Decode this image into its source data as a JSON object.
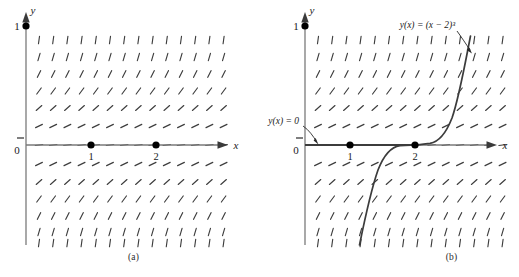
{
  "figure": {
    "panels": [
      {
        "id": "a",
        "caption": "(a)",
        "axes": {
          "x_label": "x",
          "y_label": "y",
          "y_tick_label": "1",
          "origin_label": "0"
        },
        "marked_points": [
          {
            "label": "1",
            "x": 1,
            "y": 0
          },
          {
            "label": "2",
            "x": 2,
            "y": 0
          }
        ],
        "annotations": [],
        "curves": []
      },
      {
        "id": "b",
        "caption": "(b)",
        "axes": {
          "x_label": "x",
          "y_label": "y",
          "y_tick_label": "1",
          "origin_label": "0"
        },
        "marked_points": [
          {
            "label": "1",
            "x": 1,
            "y": 0
          },
          {
            "label": "2",
            "x": 2,
            "y": 0
          }
        ],
        "annotations": [
          {
            "name": "zero-solution-label",
            "text": "y(x) = 0"
          },
          {
            "name": "cubic-solution-label",
            "text": "y(x) = (x − 2)³"
          }
        ],
        "curves": [
          {
            "name": "zero-solution",
            "equation": "y = 0"
          },
          {
            "name": "cubic-solution",
            "equation": "y = (x - 2)^3"
          }
        ]
      }
    ]
  },
  "chart_data": {
    "type": "line",
    "xlabel": "x",
    "ylabel": "y",
    "xlim": [
      -0.35,
      3.6
    ],
    "ylim": [
      -1.05,
      1.15
    ],
    "grid": false,
    "legend": "none",
    "slope_field": {
      "equation": "dy/dx = 3*y^(2/3)",
      "columns": 14,
      "rows": 13,
      "x_start": 0.18,
      "x_step": 0.25,
      "y_values": [
        1.0,
        0.82,
        0.64,
        0.46,
        0.28,
        0.1,
        0.0,
        -0.1,
        -0.28,
        -0.46,
        -0.64,
        -0.82,
        -1.0
      ],
      "note": "Segment slope grows with |y|; nearly horizontal on the x-axis row."
    },
    "series": [
      {
        "name": "y(x) = 0",
        "panel": "b",
        "type": "line",
        "x": [
          -0.2,
          0.5,
          1.0,
          1.5,
          2.0
        ],
        "values": [
          0,
          0,
          0,
          0,
          0
        ]
      },
      {
        "name": "y(x) = (x − 2)³",
        "panel": "b",
        "type": "line",
        "x": [
          0.95,
          1.1,
          1.25,
          1.4,
          1.55,
          1.7,
          1.85,
          2.0,
          2.15,
          2.3,
          2.45,
          2.6,
          2.75,
          2.9,
          3.05
        ],
        "values": [
          -1.158,
          -0.729,
          -0.422,
          -0.216,
          -0.091,
          -0.027,
          -0.003,
          0.0,
          0.003,
          0.027,
          0.091,
          0.216,
          0.422,
          0.729,
          1.158
        ]
      }
    ],
    "annotated_points": [
      {
        "label": "1",
        "x": 1,
        "y": 0
      },
      {
        "label": "2",
        "x": 2,
        "y": 0
      }
    ],
    "tick_labels": {
      "y": [
        "0",
        "1"
      ],
      "x": [
        "1",
        "2"
      ]
    },
    "colors": {
      "field": "#3d3d3d",
      "axis": "#6b6b6b",
      "curve": "#404040",
      "point": "#000000",
      "background": "#ffffff"
    }
  }
}
